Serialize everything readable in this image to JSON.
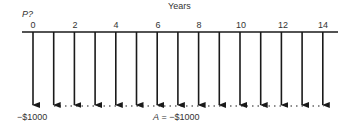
{
  "diagram": {
    "type": "cash-flow-diagram",
    "axis_title": "Years",
    "present_value_label": "P?",
    "tick_labels": [
      "0",
      "2",
      "4",
      "6",
      "8",
      "10",
      "12",
      "14"
    ],
    "tick_years": [
      0,
      2,
      4,
      6,
      8,
      10,
      12,
      14
    ],
    "periods": [
      0,
      1,
      2,
      3,
      4,
      5,
      6,
      7,
      8,
      9,
      10,
      11,
      12,
      13,
      14
    ],
    "initial_cashflow_label": "−$1000",
    "annuity_label_var": "A",
    "annuity_label_eq": " = −$1000",
    "cashflows": [
      {
        "year": 0,
        "amount": -1000
      },
      {
        "year": 1,
        "amount": -1000
      },
      {
        "year": 2,
        "amount": -1000
      },
      {
        "year": 3,
        "amount": -1000
      },
      {
        "year": 4,
        "amount": -1000
      },
      {
        "year": 5,
        "amount": -1000
      },
      {
        "year": 6,
        "amount": -1000
      },
      {
        "year": 7,
        "amount": -1000
      },
      {
        "year": 8,
        "amount": -1000
      },
      {
        "year": 9,
        "amount": -1000
      },
      {
        "year": 10,
        "amount": -1000
      },
      {
        "year": 11,
        "amount": -1000
      },
      {
        "year": 12,
        "amount": -1000
      },
      {
        "year": 13,
        "amount": -1000
      },
      {
        "year": 14,
        "amount": -1000
      }
    ],
    "colors": {
      "line": "#1a1a1a",
      "text": "#333333"
    }
  }
}
